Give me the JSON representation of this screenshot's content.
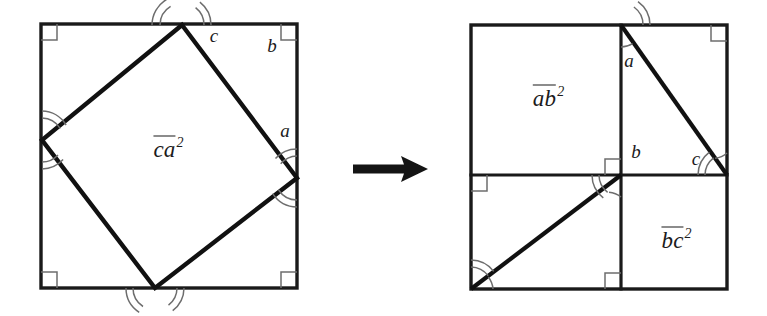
{
  "figure": {
    "background_color": "#ffffff",
    "line_color": "#1a1a1a",
    "arc_color": "#6d6d6d",
    "left_panel": {
      "name": "tilted-square-in-square",
      "outer_square": {
        "x": 41,
        "y": 24,
        "width": 256,
        "height": 264
      },
      "inner_square_vertices": [
        {
          "x": 182,
          "y": 25
        },
        {
          "x": 297,
          "y": 178
        },
        {
          "x": 155,
          "y": 288
        },
        {
          "x": 42,
          "y": 140
        }
      ],
      "area_label": {
        "base": "ca",
        "exponent": "2",
        "x": 168,
        "y": 148
      },
      "side_labels": [
        {
          "text": "c",
          "x": 214,
          "y": 42
        },
        {
          "text": "b",
          "x": 272,
          "y": 52
        },
        {
          "text": "a",
          "x": 285,
          "y": 137
        }
      ]
    },
    "arrow": {
      "name": "transform-arrow",
      "x_start": 353,
      "x_end": 428,
      "y": 169
    },
    "right_panel": {
      "name": "dissected-squares",
      "outer_square": {
        "x": 471,
        "y": 25,
        "width": 256,
        "height": 264
      },
      "vertical_divider_x": 621,
      "horizontal_divider_y": 175,
      "upper_diagonal": {
        "x1": 621,
        "y1": 25,
        "x2": 727,
        "y2": 175
      },
      "lower_diagonal": {
        "x1": 471,
        "y1": 289,
        "x2": 621,
        "y2": 175
      },
      "area_labels": [
        {
          "base": "ab",
          "exponent": "2",
          "x": 548,
          "y": 97
        },
        {
          "base": "bc",
          "exponent": "2",
          "x": 676,
          "y": 239
        }
      ],
      "side_labels": [
        {
          "text": "a",
          "x": 629,
          "y": 67
        },
        {
          "text": "b",
          "x": 636,
          "y": 158
        },
        {
          "text": "c",
          "x": 696,
          "y": 165
        }
      ]
    }
  }
}
